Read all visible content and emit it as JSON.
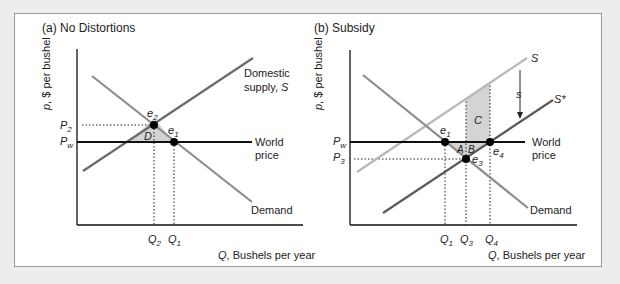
{
  "panel_a": {
    "title": "(a) No Distortions",
    "y_axis_label": "p, $ per bushel",
    "x_axis_label": "Q, Bushels per year",
    "price_labels": {
      "p2": "P",
      "p2_sub": "2",
      "pw": "P",
      "pw_sub": "w"
    },
    "quantity_labels": {
      "q2": "Q",
      "q2_sub": "2",
      "q1": "Q",
      "q1_sub": "1"
    },
    "curves": {
      "supply_label_1": "Domestic",
      "supply_label_2": "supply, ",
      "supply_label_s": "S",
      "demand_label": "Demand",
      "world_label_1": "World",
      "world_label_2": "price"
    },
    "points": {
      "e2": "e",
      "e2_sub": "2",
      "e1": "e",
      "e1_sub": "1"
    },
    "areas": {
      "d": "D"
    }
  },
  "panel_b": {
    "title": "(b) Subsidy",
    "y_axis_label": "p, $ per bushel",
    "x_axis_label": "Q, Bushels per year",
    "price_labels": {
      "pw": "P",
      "pw_sub": "w",
      "p3": "P",
      "p3_sub": "3"
    },
    "quantity_labels": {
      "q1": "Q",
      "q1_sub": "1",
      "q3": "Q",
      "q3_sub": "3",
      "q4": "Q",
      "q4_sub": "4"
    },
    "curves": {
      "supply_label": "S",
      "supply_star_label": "S*",
      "subsidy_label": "s",
      "demand_label": "Demand",
      "world_label_1": "World",
      "world_label_2": "price"
    },
    "points": {
      "e1": "e",
      "e1_sub": "1",
      "e3": "e",
      "e3_sub": "3",
      "e4": "e",
      "e4_sub": "4"
    },
    "areas": {
      "a": "A",
      "b": "B",
      "c": "C"
    }
  },
  "colors": {
    "axis": "#111111",
    "world_price": "#111111",
    "supply_a": "#6a6a6a",
    "demand": "#8c8c8c",
    "supply_b": "#b8b8b8",
    "supply_star": "#5a5a5a",
    "shade": "#d4d4d4",
    "background": "#ededed"
  }
}
